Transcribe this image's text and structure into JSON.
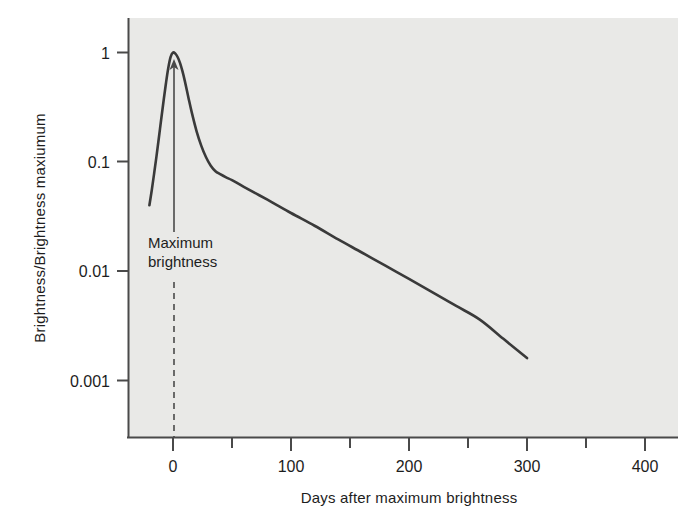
{
  "chart_data": {
    "type": "line",
    "title": "",
    "xlabel": "Days after maximum brightness",
    "ylabel": "Brightness/Brightness maxiumum",
    "yscale": "log",
    "xscale": "linear",
    "xlim": [
      -40,
      420
    ],
    "ylim": [
      0.0006,
      1.6
    ],
    "grid": false,
    "legend": "none",
    "xticks": [
      0,
      100,
      200,
      300,
      400
    ],
    "xtick_labels": [
      "0",
      "100",
      "200",
      "300",
      "400"
    ],
    "xminor_ticks": [
      50,
      150,
      250,
      350
    ],
    "yticks": [
      1,
      0.1,
      0.01,
      0.001
    ],
    "ytick_labels": [
      "1",
      "0.1",
      "0.01",
      "0.001"
    ],
    "series": [
      {
        "name": "Supernova light curve",
        "color": "#3a3a3a",
        "x": [
          -20,
          -18,
          -16,
          -14,
          -12,
          -10,
          -8,
          -6,
          -4,
          -2,
          0,
          2,
          4,
          6,
          8,
          10,
          13,
          16,
          20,
          24,
          28,
          32,
          36,
          40,
          45,
          50,
          60,
          80,
          100,
          120,
          140,
          160,
          180,
          200,
          220,
          240,
          260,
          280,
          300
        ],
        "y": [
          0.04,
          0.055,
          0.078,
          0.112,
          0.165,
          0.245,
          0.36,
          0.52,
          0.72,
          0.91,
          1.0,
          0.975,
          0.905,
          0.8,
          0.675,
          0.55,
          0.39,
          0.28,
          0.19,
          0.14,
          0.11,
          0.092,
          0.082,
          0.077,
          0.072,
          0.068,
          0.059,
          0.045,
          0.034,
          0.026,
          0.0195,
          0.0148,
          0.0112,
          0.0085,
          0.0064,
          0.0048,
          0.0036,
          0.0024,
          0.0016
        ]
      }
    ],
    "annotations": [
      {
        "name": "maximum-brightness",
        "text_line1": "Maximum",
        "text_line2": "brightness",
        "points_to_x": 0,
        "points_to_y": 1.0
      }
    ]
  },
  "colors": {
    "plot_background": "#e9e9e7",
    "page_background": "#ffffff",
    "curve": "#3a3a3a",
    "axis": "#4a4a4a",
    "text": "#1d1d1d"
  }
}
